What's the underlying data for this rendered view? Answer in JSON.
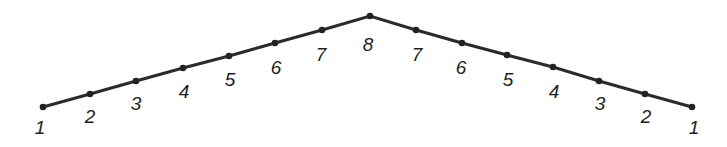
{
  "figure": {
    "name": "chevron-numbered-path-diagram",
    "width": 727,
    "height": 147,
    "background_color": "#ffffff",
    "line_color": "#2b2b2b",
    "marker_color": "#222222",
    "label_color": "#1e1e1e"
  },
  "chart_data": {
    "type": "line",
    "title": "",
    "xlabel": "",
    "ylabel": "",
    "grid": false,
    "legend": null,
    "marker": "filled-circle",
    "xlim": [
      43,
      692
    ],
    "ylim": [
      16,
      107
    ],
    "x": [
      43,
      90,
      136,
      183,
      229,
      275,
      322,
      370,
      416,
      462,
      507,
      553,
      599,
      645,
      692
    ],
    "y": [
      107,
      94,
      81,
      68,
      56,
      43,
      30,
      16,
      30,
      43,
      55,
      67,
      81,
      94,
      107
    ],
    "values": [
      1,
      2,
      3,
      4,
      5,
      6,
      7,
      8,
      7,
      6,
      5,
      4,
      3,
      2,
      1
    ],
    "point_labels": [
      "1",
      "2",
      "3",
      "4",
      "5",
      "6",
      "7",
      "8",
      "7",
      "6",
      "5",
      "4",
      "3",
      "2",
      "1"
    ]
  },
  "points": [
    {
      "label": "1",
      "value": 1,
      "x": 43,
      "y": 107,
      "label_x": 40,
      "label_y": 129
    },
    {
      "label": "2",
      "value": 2,
      "x": 90,
      "y": 94,
      "label_x": 90,
      "label_y": 118
    },
    {
      "label": "3",
      "value": 3,
      "x": 136,
      "y": 81,
      "label_x": 136,
      "label_y": 105
    },
    {
      "label": "4",
      "value": 4,
      "x": 183,
      "y": 68,
      "label_x": 184,
      "label_y": 93
    },
    {
      "label": "5",
      "value": 5,
      "x": 229,
      "y": 56,
      "label_x": 230,
      "label_y": 81
    },
    {
      "label": "6",
      "value": 6,
      "x": 275,
      "y": 43,
      "label_x": 276,
      "label_y": 69
    },
    {
      "label": "7",
      "value": 7,
      "x": 322,
      "y": 30,
      "label_x": 321,
      "label_y": 56
    },
    {
      "label": "8",
      "value": 8,
      "x": 370,
      "y": 16,
      "label_x": 368,
      "label_y": 46
    },
    {
      "label": "7",
      "value": 7,
      "x": 416,
      "y": 30,
      "label_x": 417,
      "label_y": 56
    },
    {
      "label": "6",
      "value": 6,
      "x": 462,
      "y": 43,
      "label_x": 461,
      "label_y": 69
    },
    {
      "label": "5",
      "value": 5,
      "x": 507,
      "y": 55,
      "label_x": 508,
      "label_y": 81
    },
    {
      "label": "4",
      "value": 4,
      "x": 553,
      "y": 67,
      "label_x": 554,
      "label_y": 93
    },
    {
      "label": "3",
      "value": 3,
      "x": 599,
      "y": 81,
      "label_x": 600,
      "label_y": 105
    },
    {
      "label": "2",
      "value": 2,
      "x": 645,
      "y": 94,
      "label_x": 646,
      "label_y": 118
    },
    {
      "label": "1",
      "value": 1,
      "x": 692,
      "y": 107,
      "label_x": 694,
      "label_y": 129
    }
  ]
}
